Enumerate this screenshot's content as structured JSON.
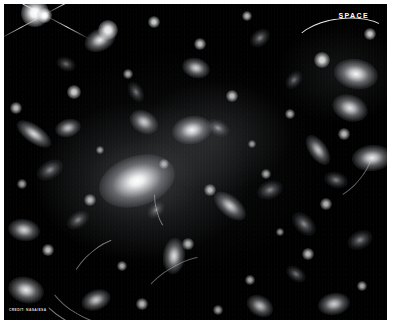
{
  "image": {
    "subject": "galaxy-cluster-gravitational-lensing",
    "border_color": "#ffffff",
    "sky_color": "#000000"
  },
  "watermark": {
    "label": "SPACE",
    "swoosh": "logo-arc"
  },
  "credit": {
    "text": "CREDIT: NASA/ESA"
  },
  "sky_objects": {
    "central_galaxy": {
      "name": "brightest-cluster-galaxy"
    },
    "stars": [
      {
        "x": 31,
        "y": 9,
        "r": 7,
        "b": 1.0
      },
      {
        "x": 104,
        "y": 26,
        "r": 5,
        "b": 0.92
      },
      {
        "x": 150,
        "y": 18,
        "r": 3,
        "b": 0.8
      },
      {
        "x": 196,
        "y": 40,
        "r": 3,
        "b": 0.75
      },
      {
        "x": 243,
        "y": 12,
        "r": 2.5,
        "b": 0.7
      },
      {
        "x": 318,
        "y": 56,
        "r": 4,
        "b": 0.85
      },
      {
        "x": 366,
        "y": 30,
        "r": 3,
        "b": 0.78
      },
      {
        "x": 12,
        "y": 104,
        "r": 3,
        "b": 0.72
      },
      {
        "x": 70,
        "y": 88,
        "r": 3.5,
        "b": 0.8
      },
      {
        "x": 124,
        "y": 70,
        "r": 2.5,
        "b": 0.65
      },
      {
        "x": 228,
        "y": 92,
        "r": 3,
        "b": 0.74
      },
      {
        "x": 286,
        "y": 110,
        "r": 2.5,
        "b": 0.66
      },
      {
        "x": 340,
        "y": 130,
        "r": 3,
        "b": 0.72
      },
      {
        "x": 18,
        "y": 180,
        "r": 2.5,
        "b": 0.62
      },
      {
        "x": 86,
        "y": 196,
        "r": 3,
        "b": 0.7
      },
      {
        "x": 160,
        "y": 160,
        "r": 2.5,
        "b": 0.68
      },
      {
        "x": 206,
        "y": 186,
        "r": 3,
        "b": 0.72
      },
      {
        "x": 262,
        "y": 170,
        "r": 2.5,
        "b": 0.64
      },
      {
        "x": 322,
        "y": 200,
        "r": 3,
        "b": 0.7
      },
      {
        "x": 44,
        "y": 246,
        "r": 3,
        "b": 0.74
      },
      {
        "x": 118,
        "y": 262,
        "r": 2.5,
        "b": 0.66
      },
      {
        "x": 184,
        "y": 240,
        "r": 3,
        "b": 0.7
      },
      {
        "x": 246,
        "y": 276,
        "r": 2.5,
        "b": 0.64
      },
      {
        "x": 304,
        "y": 250,
        "r": 3,
        "b": 0.72
      },
      {
        "x": 358,
        "y": 282,
        "r": 2.5,
        "b": 0.66
      },
      {
        "x": 138,
        "y": 300,
        "r": 3,
        "b": 0.7
      },
      {
        "x": 214,
        "y": 306,
        "r": 2.5,
        "b": 0.62
      },
      {
        "x": 276,
        "y": 228,
        "r": 2,
        "b": 0.58
      },
      {
        "x": 96,
        "y": 146,
        "r": 2,
        "b": 0.6
      },
      {
        "x": 248,
        "y": 140,
        "r": 2,
        "b": 0.58
      }
    ],
    "galaxies": [
      {
        "x": 96,
        "y": 36,
        "w": 16,
        "h": 11,
        "rot": -25,
        "b": 0.95
      },
      {
        "x": 192,
        "y": 64,
        "w": 14,
        "h": 10,
        "rot": 15,
        "b": 0.85
      },
      {
        "x": 256,
        "y": 34,
        "w": 11,
        "h": 8,
        "rot": -40,
        "b": 0.7
      },
      {
        "x": 352,
        "y": 70,
        "w": 22,
        "h": 15,
        "rot": 10,
        "b": 1.0
      },
      {
        "x": 346,
        "y": 104,
        "w": 18,
        "h": 13,
        "rot": 20,
        "b": 0.92
      },
      {
        "x": 30,
        "y": 130,
        "w": 20,
        "h": 9,
        "rot": 35,
        "b": 0.88
      },
      {
        "x": 64,
        "y": 124,
        "w": 13,
        "h": 9,
        "rot": -15,
        "b": 0.78
      },
      {
        "x": 140,
        "y": 118,
        "w": 15,
        "h": 11,
        "rot": 30,
        "b": 0.82
      },
      {
        "x": 188,
        "y": 126,
        "w": 20,
        "h": 14,
        "rot": -10,
        "b": 0.98
      },
      {
        "x": 214,
        "y": 124,
        "w": 12,
        "h": 8,
        "rot": 25,
        "b": 0.76
      },
      {
        "x": 314,
        "y": 146,
        "w": 17,
        "h": 9,
        "rot": 55,
        "b": 0.8
      },
      {
        "x": 368,
        "y": 154,
        "w": 20,
        "h": 13,
        "rot": -5,
        "b": 0.96
      },
      {
        "x": 46,
        "y": 166,
        "w": 14,
        "h": 9,
        "rot": -30,
        "b": 0.74
      },
      {
        "x": 226,
        "y": 202,
        "w": 19,
        "h": 10,
        "rot": 40,
        "b": 0.84
      },
      {
        "x": 266,
        "y": 186,
        "w": 13,
        "h": 9,
        "rot": -20,
        "b": 0.72
      },
      {
        "x": 332,
        "y": 176,
        "w": 12,
        "h": 8,
        "rot": 15,
        "b": 0.7
      },
      {
        "x": 20,
        "y": 226,
        "w": 16,
        "h": 11,
        "rot": 10,
        "b": 0.86
      },
      {
        "x": 74,
        "y": 216,
        "w": 12,
        "h": 8,
        "rot": -35,
        "b": 0.7
      },
      {
        "x": 170,
        "y": 252,
        "w": 11,
        "h": 18,
        "rot": 5,
        "b": 0.9
      },
      {
        "x": 300,
        "y": 220,
        "w": 14,
        "h": 9,
        "rot": 45,
        "b": 0.74
      },
      {
        "x": 356,
        "y": 236,
        "w": 13,
        "h": 9,
        "rot": -25,
        "b": 0.72
      },
      {
        "x": 22,
        "y": 286,
        "w": 18,
        "h": 13,
        "rot": 15,
        "b": 0.94
      },
      {
        "x": 92,
        "y": 296,
        "w": 15,
        "h": 10,
        "rot": -20,
        "b": 0.82
      },
      {
        "x": 256,
        "y": 302,
        "w": 14,
        "h": 10,
        "rot": 30,
        "b": 0.78
      },
      {
        "x": 330,
        "y": 300,
        "w": 16,
        "h": 11,
        "rot": -10,
        "b": 0.84
      },
      {
        "x": 132,
        "y": 88,
        "w": 11,
        "h": 7,
        "rot": 60,
        "b": 0.62
      },
      {
        "x": 290,
        "y": 76,
        "w": 10,
        "h": 7,
        "rot": -50,
        "b": 0.6
      },
      {
        "x": 62,
        "y": 60,
        "w": 10,
        "h": 7,
        "rot": 20,
        "b": 0.58
      },
      {
        "x": 152,
        "y": 206,
        "w": 10,
        "h": 7,
        "rot": -45,
        "b": 0.6
      },
      {
        "x": 292,
        "y": 270,
        "w": 11,
        "h": 7,
        "rot": 35,
        "b": 0.62
      }
    ],
    "lensing_arcs": [
      {
        "x": 10,
        "y": 120,
        "size": 210,
        "rot": 200,
        "seg": 38,
        "w": 1.5,
        "op": 0.55
      },
      {
        "x": 30,
        "y": 150,
        "size": 170,
        "rot": 210,
        "seg": 34,
        "w": 1.2,
        "op": 0.45
      },
      {
        "x": 60,
        "y": 230,
        "size": 150,
        "rot": 320,
        "seg": 30,
        "w": 1.3,
        "op": 0.5
      },
      {
        "x": 150,
        "y": 130,
        "size": 120,
        "rot": 255,
        "seg": 26,
        "w": 1.4,
        "op": 0.48
      },
      {
        "x": 230,
        "y": 60,
        "size": 140,
        "rot": 130,
        "seg": 30,
        "w": 1.2,
        "op": 0.42
      },
      {
        "x": 120,
        "y": 250,
        "size": 190,
        "rot": 330,
        "seg": 28,
        "w": 1.1,
        "op": 0.4
      }
    ]
  }
}
